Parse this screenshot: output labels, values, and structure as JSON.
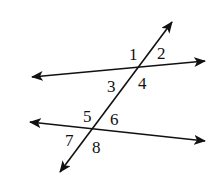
{
  "diagram": {
    "colors": {
      "stroke": "#111111",
      "background": "#ffffff"
    },
    "lines": [
      {
        "id": "upper-line",
        "x1": 32,
        "y1": 77,
        "x2": 205,
        "y2": 61
      },
      {
        "id": "lower-line",
        "x1": 30,
        "y1": 122,
        "x2": 205,
        "y2": 141
      },
      {
        "id": "transversal",
        "x1": 172,
        "y1": 22,
        "x2": 60,
        "y2": 172
      }
    ],
    "angle_labels": [
      {
        "text": "1",
        "x": 129,
        "y": 60
      },
      {
        "text": "2",
        "x": 157,
        "y": 59
      },
      {
        "text": "3",
        "x": 107,
        "y": 92
      },
      {
        "text": "4",
        "x": 138,
        "y": 89
      },
      {
        "text": "5",
        "x": 83,
        "y": 122
      },
      {
        "text": "6",
        "x": 110,
        "y": 125
      },
      {
        "text": "7",
        "x": 65,
        "y": 146
      },
      {
        "text": "8",
        "x": 92,
        "y": 153
      }
    ]
  }
}
